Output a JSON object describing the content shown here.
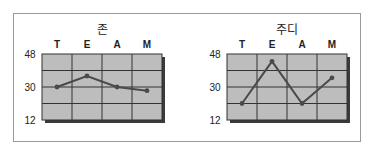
{
  "chart_data": [
    {
      "type": "line",
      "title": "존",
      "categories": [
        "T",
        "E",
        "A",
        "M"
      ],
      "values": [
        30,
        36,
        30,
        28
      ],
      "ylim": [
        12,
        48
      ],
      "yticks": [
        48,
        30,
        12
      ],
      "grid": true,
      "xlabel": "",
      "ylabel": "",
      "legend": "none"
    },
    {
      "type": "line",
      "title": "주디",
      "categories": [
        "T",
        "E",
        "A",
        "M"
      ],
      "values": [
        21,
        44,
        21,
        35
      ],
      "ylim": [
        12,
        48
      ],
      "yticks": [
        48,
        30,
        12
      ],
      "grid": true,
      "xlabel": "",
      "ylabel": "",
      "legend": "none"
    }
  ],
  "colors": {
    "plot_bg": "#bdbdbd",
    "grid": "#333333",
    "line": "#4a4a4a",
    "shadow": "#3a3a3a",
    "frame": "#9a9a9a"
  }
}
